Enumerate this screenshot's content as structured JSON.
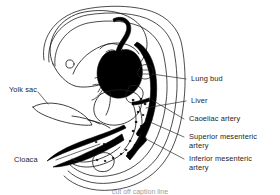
{
  "figure": {
    "type": "anatomical-line-drawing",
    "stroke_color": "#1a1a1a",
    "fill_color": "#000000",
    "background": "#ffffff",
    "leader_line_color": "#2b2b2b"
  },
  "labels": {
    "yolk_sac": "Yolk sac",
    "cloaca": "Cloaca",
    "lung_bud": "Lung bud",
    "liver": "Liver",
    "caoeliac_artery": "Caoeliac artery",
    "superior_mesenteric_artery": "Superior mesenteric\nartery",
    "inferior_mesenteric_artery": "Inferior mesenteric\nartery"
  },
  "caption": {
    "text": "cut off caption line"
  }
}
